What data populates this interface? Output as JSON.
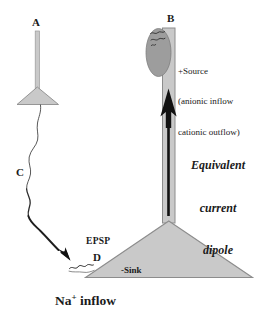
{
  "figure": {
    "title_alt": "Equivalent current dipole in a cortical pyramidal neuron",
    "colors": {
      "cell_fill": "#c9c9c9",
      "cell_stroke": "#8c8c8c",
      "bouton_fill": "#9d9d9d",
      "bouton_stroke": "#7a7a7a",
      "axon_stroke": "#2b2b2b",
      "arrow_fill": "#111111",
      "text": "#1a1a1a",
      "background": "#ffffff"
    }
  },
  "labels": {
    "presynaptic_neuron": "A",
    "dendrite_top": "B",
    "axon": "C",
    "synapse_site": "D",
    "epsp": "EPSP",
    "sink": "-Sink",
    "source_title": "+Source",
    "source_line1": "(anionic inflow",
    "source_line2": "cationic outflow)",
    "dipole_line1": "Equivalent",
    "dipole_line2": "current",
    "dipole_line3": "dipole",
    "na_text_before": "Na",
    "na_superscript": "+",
    "na_text_after": " inflow"
  },
  "icons": {
    "current_arrow": "up-arrow-icon",
    "synapse_arrow": "synapse-arrow-icon",
    "bouton": "synaptic-bouton-icon",
    "soma_a": "triangular-soma-icon",
    "soma_pyramidal": "pyramidal-soma-icon"
  }
}
